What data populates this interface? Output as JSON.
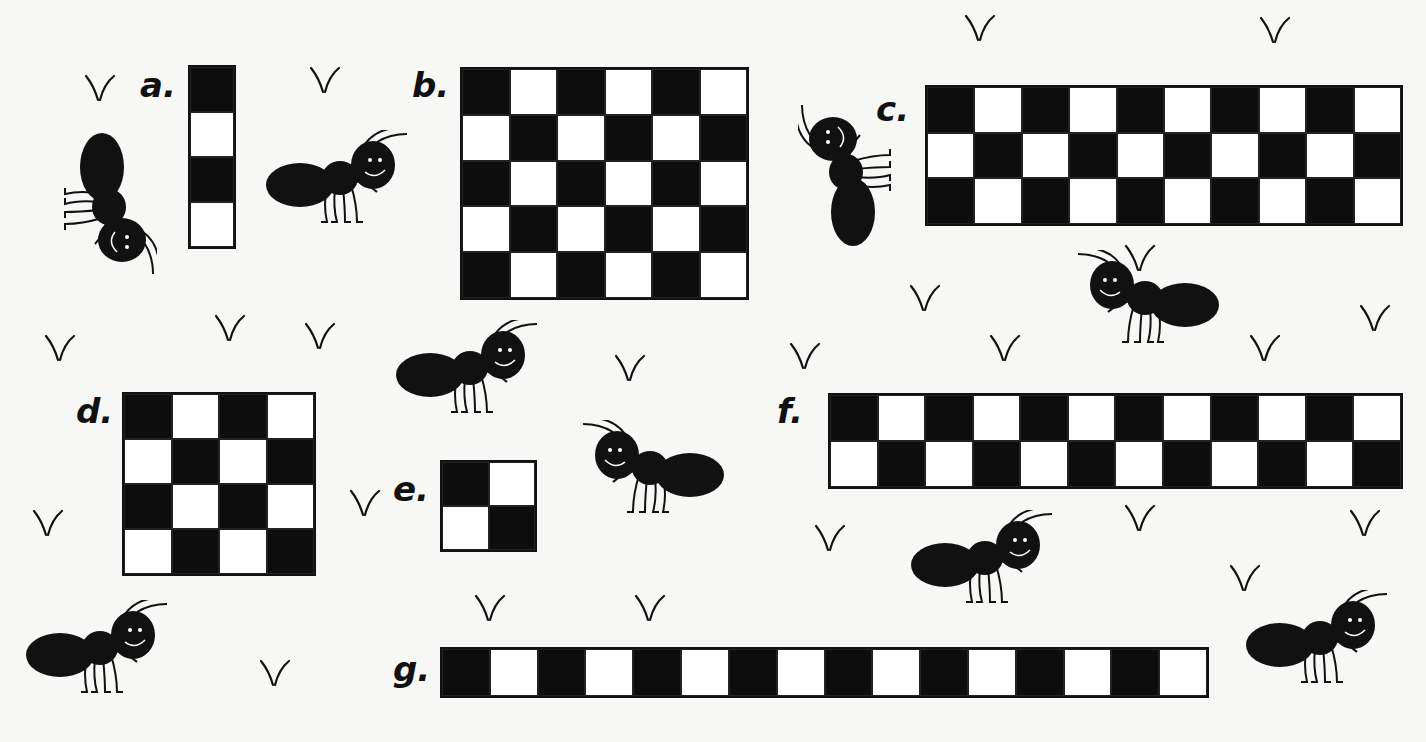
{
  "puzzles": [
    {
      "label": "a.",
      "rows": 4,
      "cols": 1,
      "x": 188,
      "y": 65,
      "w": 48,
      "h": 184,
      "lx": 140,
      "ly": 68
    },
    {
      "label": "b.",
      "rows": 5,
      "cols": 6,
      "x": 460,
      "y": 67,
      "w": 289,
      "h": 233,
      "lx": 412,
      "ly": 68
    },
    {
      "label": "c.",
      "rows": 3,
      "cols": 10,
      "x": 925,
      "y": 85,
      "w": 478,
      "h": 141,
      "lx": 876,
      "ly": 92
    },
    {
      "label": "d.",
      "rows": 4,
      "cols": 4,
      "x": 122,
      "y": 392,
      "w": 194,
      "h": 184,
      "lx": 76,
      "ly": 394
    },
    {
      "label": "e.",
      "rows": 2,
      "cols": 2,
      "x": 440,
      "y": 460,
      "w": 97,
      "h": 92,
      "lx": 393,
      "ly": 472
    },
    {
      "label": "f.",
      "rows": 2,
      "cols": 12,
      "x": 828,
      "y": 393,
      "w": 575,
      "h": 96,
      "lx": 777,
      "ly": 394
    },
    {
      "label": "g.",
      "rows": 1,
      "cols": 16,
      "x": 440,
      "y": 647,
      "w": 769,
      "h": 51,
      "lx": 393,
      "ly": 652
    }
  ],
  "colors": {
    "dark": "#0d0d0d",
    "light": "#ffffff",
    "background": "#f7f7f5"
  },
  "decorations": {
    "ants": [
      {
        "x": 30,
        "y": 155,
        "rot": 90
      },
      {
        "x": 265,
        "y": 130,
        "rot": 0
      },
      {
        "x": 775,
        "y": 120,
        "rot": -90
      },
      {
        "x": 1070,
        "y": 250,
        "rot": 0,
        "flip": true
      },
      {
        "x": 395,
        "y": 320,
        "rot": 0
      },
      {
        "x": 575,
        "y": 420,
        "rot": 0,
        "flip": true
      },
      {
        "x": 910,
        "y": 510,
        "rot": 0
      },
      {
        "x": 25,
        "y": 600,
        "rot": 0
      },
      {
        "x": 1245,
        "y": 590,
        "rot": 0
      }
    ],
    "grass": [
      [
        80,
        70
      ],
      [
        305,
        62
      ],
      [
        960,
        10
      ],
      [
        1255,
        12
      ],
      [
        40,
        330
      ],
      [
        210,
        310
      ],
      [
        300,
        318
      ],
      [
        610,
        350
      ],
      [
        785,
        338
      ],
      [
        905,
        280
      ],
      [
        985,
        330
      ],
      [
        1120,
        240
      ],
      [
        1245,
        330
      ],
      [
        1355,
        300
      ],
      [
        28,
        505
      ],
      [
        345,
        485
      ],
      [
        1120,
        500
      ],
      [
        1345,
        505
      ],
      [
        810,
        520
      ],
      [
        470,
        590
      ],
      [
        630,
        590
      ],
      [
        1225,
        560
      ],
      [
        255,
        655
      ]
    ]
  }
}
